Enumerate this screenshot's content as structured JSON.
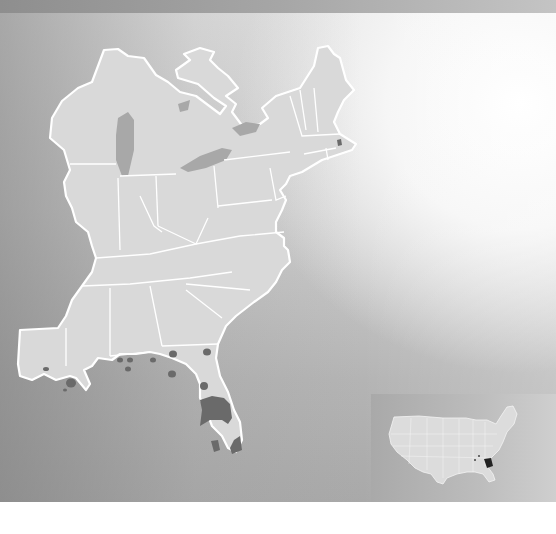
{
  "figure": {
    "type": "range-map",
    "region": "Eastern United States",
    "text_labels": [],
    "colors": {
      "land": "#d9d9d9",
      "state_borders": "#ffffff",
      "water_left": "#8e8e8e",
      "water_right": "#ffffff",
      "range_fill": "#6a6a6a",
      "inset_background": "#b4b4b4",
      "inset_highlight": "#222222"
    },
    "range_areas": [
      {
        "name": "central-florida-block",
        "shape": "band"
      },
      {
        "name": "south-florida-west-patch",
        "shape": "blob"
      },
      {
        "name": "south-florida-east-patch",
        "shape": "blob"
      },
      {
        "name": "north-florida-dots",
        "count": 2
      },
      {
        "name": "georgia-dots",
        "count": 2
      },
      {
        "name": "alabama-dots",
        "count": 4
      },
      {
        "name": "louisiana-dots",
        "count": 3
      },
      {
        "name": "massachusetts-dot",
        "count": 1
      }
    ],
    "inset": {
      "description": "Contiguous United States locator map",
      "highlight": "Florida"
    }
  }
}
